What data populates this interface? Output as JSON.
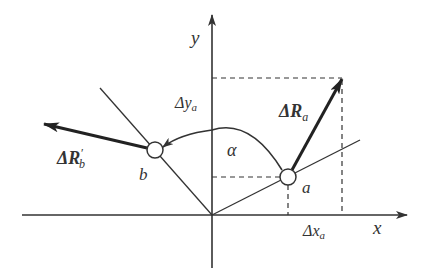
{
  "diagram": {
    "colors": {
      "stroke": "#333333",
      "background": "#ffffff",
      "circle_fill": "#ffffff"
    },
    "axes": {
      "x_label": "x",
      "y_label": "y"
    },
    "points": {
      "a": {
        "label": "a"
      },
      "b": {
        "label": "b"
      }
    },
    "vectors": {
      "delta_R_a": {
        "label_prefix": "ΔR",
        "subscript": "a"
      },
      "delta_R_b_prime": {
        "label_prefix": "ΔR",
        "prime": "′",
        "subscript": "b"
      }
    },
    "projections": {
      "delta_x_a": {
        "label_prefix": "Δx",
        "subscript": "a"
      },
      "delta_y_a": {
        "label_prefix": "Δy",
        "subscript": "a"
      }
    },
    "angle": {
      "label": "α"
    }
  }
}
